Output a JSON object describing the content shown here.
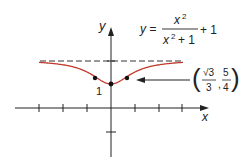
{
  "chart_data": {
    "type": "line",
    "equation": {
      "lhs": "y =",
      "numerator": "x",
      "numerator_exp": "2",
      "denominator": "x",
      "denominator_exp": "2",
      "denominator_tail": "+ 1",
      "tail": "+ 1"
    },
    "xlabel": "x",
    "ylabel": "y",
    "xlim": [
      -3,
      3
    ],
    "ylim": [
      -1,
      2.5
    ],
    "x_ticks": [
      -3,
      -2,
      -1,
      1,
      2,
      3
    ],
    "y_ticks": [
      -1,
      1,
      2
    ],
    "asymptote": {
      "y": 2,
      "style": "dashed"
    },
    "series": [
      {
        "name": "y = x^2/(x^2+1) + 1",
        "color": "#c0392b",
        "x": [
          -3,
          -2.5,
          -2,
          -1.5,
          -1,
          -0.577,
          -0.25,
          0,
          0.25,
          0.577,
          1,
          1.5,
          2,
          2.5,
          3
        ],
        "y": [
          1.9,
          1.862,
          1.8,
          1.692,
          1.5,
          1.25,
          1.059,
          1,
          1.059,
          1.25,
          1.5,
          1.692,
          1.8,
          1.862,
          1.9
        ]
      }
    ],
    "points": [
      {
        "x": -0.577,
        "y": 1.25,
        "label": ""
      },
      {
        "x": 0,
        "y": 1,
        "label": "1"
      },
      {
        "x": 0.577,
        "y": 1.25,
        "label": ""
      }
    ],
    "annotation": {
      "text": "(√3/3, 5/4)",
      "sqrt_num": "√3",
      "den1": "3",
      "num2": "5",
      "den2": "4",
      "comma": ","
    },
    "point_label": "1"
  }
}
